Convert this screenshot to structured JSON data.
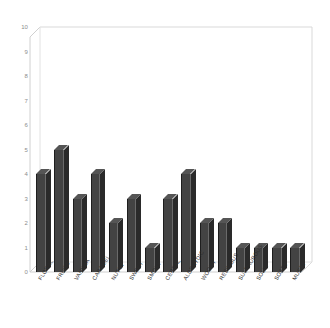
{
  "chart_data": {
    "type": "bar",
    "title": "",
    "subtitle": "",
    "xlabel": "",
    "ylabel": "",
    "ylim": [
      0,
      10
    ],
    "ytick_labels": [
      "10",
      "9",
      "8",
      "7",
      "6",
      "5",
      "4",
      "3",
      "2",
      "1",
      "0"
    ],
    "ytick_values": [
      10,
      9,
      8,
      7,
      6,
      5,
      4,
      3,
      2,
      1,
      0
    ],
    "grid": false,
    "legend": null,
    "legend_position": "none",
    "style": "3d-column",
    "bar_color": "#434343",
    "bar_side_color": "#2a2a2a",
    "bar_top_color": "#555555",
    "axis_color": "#d8d8d8",
    "tick_label_color": "#8c8c8c",
    "category_label_color": "#2d2d2d",
    "background_color": "#ffffff",
    "categories": [
      "FLORAL",
      "FRUITY",
      "VANILLA",
      "CARAMEL",
      "NUTTY",
      "SWEET",
      "SMOKY",
      "CEREAL",
      "ALDEHYDIC",
      "WOODY",
      "RESINOUS",
      "SULPHUROUS",
      "SOUR",
      "SOAPY",
      "MUSTY"
    ],
    "values": [
      4,
      5,
      3,
      4,
      2,
      3,
      1,
      3,
      4,
      2,
      2,
      1,
      1,
      1,
      1
    ]
  }
}
